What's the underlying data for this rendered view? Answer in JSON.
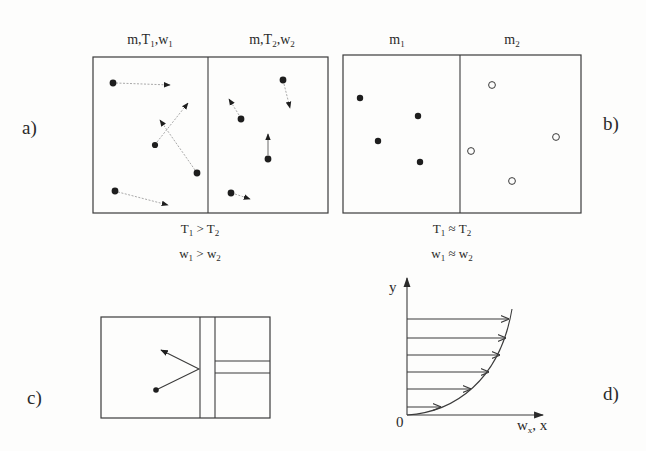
{
  "figure": {
    "panel_a": {
      "label": "a)",
      "header_left": [
        "m,T",
        "1",
        ",w",
        "1"
      ],
      "header_right": [
        "m,T",
        "2",
        ",w",
        "2"
      ],
      "condition_temperature": [
        "T",
        "1",
        " > T",
        "2"
      ],
      "condition_velocity": [
        "w",
        "1",
        " > w",
        "2"
      ],
      "particles": {
        "left": 4,
        "right": 4,
        "style": "filled dots with velocity arrows"
      }
    },
    "panel_b": {
      "label": "b)",
      "header_left": [
        "m",
        "1"
      ],
      "header_right": [
        "m",
        "2"
      ],
      "condition_temperature": [
        "T",
        "1",
        " ≈ T",
        "2"
      ],
      "condition_velocity": [
        "w",
        "1",
        " ≈ w",
        "2"
      ],
      "particles": {
        "left": 4,
        "left_style": "filled",
        "right": 4,
        "right_style": "open"
      }
    },
    "panel_c": {
      "label": "c)",
      "description": "particle reflecting off a wall"
    },
    "panel_d": {
      "label": "d)",
      "y_axis_label": "y",
      "origin_label": "0",
      "x_axis_label": [
        "w",
        "x",
        ", x"
      ],
      "velocity_arrows": 6
    }
  }
}
